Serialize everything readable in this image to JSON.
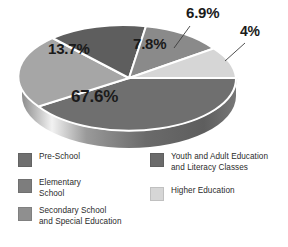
{
  "chart_data": {
    "type": "pie",
    "title": "",
    "subtitle": "",
    "xlabel": "",
    "ylabel": "",
    "grid": false,
    "three_d": true,
    "legend_position": "bottom",
    "value_suffix": "%",
    "categories": [
      "Pre-School",
      "Elementary School",
      "Secondary School and Special Education",
      "Youth and Adult Education and Literacy Classes",
      "Higher Education"
    ],
    "values": [
      67.6,
      13.7,
      7.8,
      6.9,
      4
    ],
    "labels": [
      "67.6%",
      "13.7%",
      "7.8%",
      "6.9%",
      "4%"
    ],
    "colors": [
      "#6f6f6f",
      "#a6a6a6",
      "#5e5e5e",
      "#8a8a8a",
      "#d6d6d6"
    ],
    "slices": [
      {
        "label": "67.6%",
        "value": 67.6,
        "category": "Pre-School",
        "color": "#6f6f6f"
      },
      {
        "label": "13.7%",
        "value": 13.7,
        "category": "Elementary School",
        "color": "#a6a6a6"
      },
      {
        "label": "7.8%",
        "value": 7.8,
        "category": "Secondary School and Special Education",
        "color": "#5e5e5e"
      },
      {
        "label": "6.9%",
        "value": 6.9,
        "category": "Youth and Adult Education and Literacy Classes",
        "color": "#8a8a8a"
      },
      {
        "label": "4%",
        "value": 4,
        "category": "Higher Education",
        "color": "#d6d6d6"
      }
    ]
  },
  "pie": {
    "label_676": "67.6%",
    "label_137": "13.7%",
    "label_78": "7.8%",
    "label_69": "6.9%",
    "label_4": "4%"
  },
  "legend": {
    "left_column": [
      {
        "label": "Pre-School",
        "color": "#6f6f6f"
      },
      {
        "label": "Elementary\nSchool",
        "color": "#7d7d7d"
      },
      {
        "label": "Secondary School\nand Special Education",
        "color": "#8f8f8f"
      }
    ],
    "right_column": [
      {
        "label": "Youth and Adult Education\nand Literacy Classes",
        "color": "#6b6b6b"
      },
      {
        "label": "Higher Education",
        "color": "#d6d6d6"
      }
    ]
  }
}
